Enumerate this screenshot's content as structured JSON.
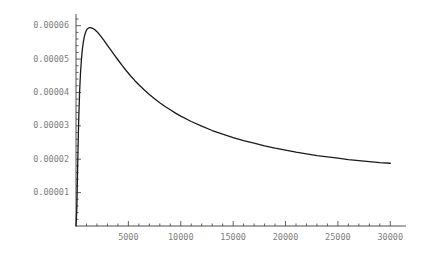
{
  "chart_data": {
    "type": "line",
    "title": "",
    "subtitle": "",
    "xlabel": "",
    "ylabel": "",
    "xlim": [
      0,
      31500
    ],
    "ylim": [
      0,
      6.35e-05
    ],
    "grid": false,
    "legend": null,
    "axis_origin": [
      0,
      0
    ],
    "x_tick_labels": [
      "5000",
      "10000",
      "15000",
      "20000",
      "25000",
      "30000"
    ],
    "x_tick_values": [
      5000,
      10000,
      15000,
      20000,
      25000,
      30000
    ],
    "x_minor_tick_step": 1000,
    "y_tick_labels": [
      "0.00001",
      "0.00002",
      "0.00003",
      "0.00004",
      "0.00005",
      "0.00006"
    ],
    "y_tick_values": [
      1e-05,
      2e-05,
      3e-05,
      4e-05,
      5e-05,
      6e-05
    ],
    "y_minor_tick_step": 2e-06,
    "series": [
      {
        "name": "curve",
        "color": "#1a1a1a",
        "line_width": 1.3,
        "x": [
          0,
          80,
          160,
          250,
          340,
          430,
          520,
          610,
          700,
          800,
          900,
          1000,
          1100,
          1200,
          1300,
          1400,
          1500,
          1600,
          1700,
          1800,
          1900,
          2000,
          2200,
          2400,
          2600,
          2800,
          3000,
          3300,
          3600,
          4000,
          4400,
          4800,
          5200,
          5600,
          6000,
          6500,
          7000,
          7500,
          8000,
          8500,
          9000,
          9500,
          10000,
          11000,
          12000,
          13000,
          14000,
          15000,
          16000,
          17000,
          18000,
          19000,
          20000,
          21000,
          22000,
          23000,
          24000,
          25000,
          26000,
          27000,
          28000,
          29000,
          30000
        ],
        "y": [
          0.0,
          5.5e-06,
          1.82e-05,
          3.1e-05,
          3.98e-05,
          4.58e-05,
          5e-05,
          5.3e-05,
          5.51e-05,
          5.68e-05,
          5.79e-05,
          5.87e-05,
          5.91e-05,
          5.93e-05,
          5.94e-05,
          5.94e-05,
          5.93e-05,
          5.92e-05,
          5.9e-05,
          5.88e-05,
          5.85e-05,
          5.82e-05,
          5.75e-05,
          5.67e-05,
          5.59e-05,
          5.5e-05,
          5.41e-05,
          5.28e-05,
          5.15e-05,
          4.98e-05,
          4.81e-05,
          4.65e-05,
          4.5e-05,
          4.36e-05,
          4.23e-05,
          4.08e-05,
          3.94e-05,
          3.81e-05,
          3.69e-05,
          3.58e-05,
          3.48e-05,
          3.38e-05,
          3.29e-05,
          3.13e-05,
          2.99e-05,
          2.86e-05,
          2.75e-05,
          2.65e-05,
          2.56e-05,
          2.48e-05,
          2.4e-05,
          2.33e-05,
          2.27e-05,
          2.21e-05,
          2.16e-05,
          2.11e-05,
          2.07e-05,
          2.03e-05,
          1.99e-05,
          1.96e-05,
          1.93e-05,
          1.9e-05,
          1.88e-05
        ]
      }
    ],
    "annotations": {
      "peak_x": 1400,
      "peak_y": 5.94e-05,
      "end_x": 30000,
      "end_y": 1.88e-05
    },
    "colors": {
      "background": "#ffffff",
      "axis": "#3a3a3a",
      "tick_label": "#808080",
      "curve": "#1a1a1a"
    }
  }
}
